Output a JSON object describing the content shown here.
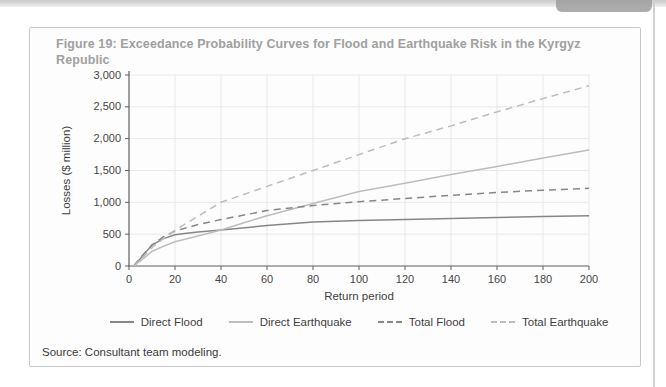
{
  "figure": {
    "title": "Figure 19: Exceedance Probability Curves for Flood and Earthquake Risk in the Kyrgyz Republic",
    "source": "Source: Consultant team modeling."
  },
  "colors": {
    "title": "#a0a0a0",
    "text": "#3f3f3f",
    "tick_text": "#454545",
    "axis": "#5f5f5f",
    "grid": "#e8e8e8",
    "border": "#c8c8c8",
    "dark_series": "#878787",
    "light_series": "#bdbdbd"
  },
  "chart_data": {
    "type": "line",
    "title": "Exceedance Probability Curves for Flood and Earthquake Risk in the Kyrgyz Republic",
    "xlabel": "Return period",
    "ylabel": "Losses ($ million)",
    "xlim": [
      0,
      200
    ],
    "ylim": [
      0,
      3000
    ],
    "grid": true,
    "legend_position": "bottom",
    "x_ticks": [
      0,
      20,
      40,
      60,
      80,
      100,
      120,
      140,
      160,
      180,
      200
    ],
    "x_tick_labels": [
      "0",
      "20",
      "40",
      "60",
      "80",
      "100",
      "120",
      "140",
      "160",
      "180",
      "200"
    ],
    "y_ticks": [
      0,
      500,
      1000,
      1500,
      2000,
      2500,
      3000
    ],
    "y_tick_labels": [
      "0",
      "500",
      "1,000",
      "1,500",
      "2,000",
      "2,500",
      "3,000"
    ],
    "series": [
      {
        "name": "Direct Flood",
        "style": "solid",
        "color": "dark",
        "points": [
          [
            2,
            0
          ],
          [
            5,
            120
          ],
          [
            10,
            330
          ],
          [
            15,
            430
          ],
          [
            20,
            490
          ],
          [
            25,
            515
          ],
          [
            30,
            535
          ],
          [
            40,
            565
          ],
          [
            60,
            635
          ],
          [
            80,
            690
          ],
          [
            100,
            715
          ],
          [
            120,
            730
          ],
          [
            140,
            748
          ],
          [
            160,
            763
          ],
          [
            180,
            778
          ],
          [
            200,
            790
          ]
        ]
      },
      {
        "name": "Direct Earthquake",
        "style": "solid",
        "color": "light",
        "points": [
          [
            2,
            0
          ],
          [
            5,
            80
          ],
          [
            10,
            230
          ],
          [
            15,
            310
          ],
          [
            20,
            380
          ],
          [
            30,
            470
          ],
          [
            40,
            565
          ],
          [
            50,
            680
          ],
          [
            60,
            790
          ],
          [
            80,
            980
          ],
          [
            100,
            1170
          ],
          [
            120,
            1300
          ],
          [
            140,
            1435
          ],
          [
            160,
            1565
          ],
          [
            180,
            1695
          ],
          [
            200,
            1820
          ]
        ]
      },
      {
        "name": "Total Flood",
        "style": "dashed",
        "color": "dark",
        "points": [
          [
            2,
            0
          ],
          [
            5,
            130
          ],
          [
            10,
            330
          ],
          [
            15,
            460
          ],
          [
            20,
            550
          ],
          [
            25,
            600
          ],
          [
            30,
            650
          ],
          [
            40,
            730
          ],
          [
            60,
            870
          ],
          [
            80,
            950
          ],
          [
            100,
            1010
          ],
          [
            120,
            1060
          ],
          [
            140,
            1110
          ],
          [
            160,
            1155
          ],
          [
            180,
            1190
          ],
          [
            200,
            1220
          ]
        ]
      },
      {
        "name": "Total Earthquake",
        "style": "dashed",
        "color": "light",
        "points": [
          [
            2,
            0
          ],
          [
            5,
            100
          ],
          [
            10,
            290
          ],
          [
            15,
            430
          ],
          [
            20,
            560
          ],
          [
            30,
            780
          ],
          [
            40,
            1000
          ],
          [
            60,
            1250
          ],
          [
            80,
            1500
          ],
          [
            100,
            1750
          ],
          [
            120,
            2000
          ],
          [
            140,
            2200
          ],
          [
            160,
            2420
          ],
          [
            180,
            2630
          ],
          [
            200,
            2830
          ]
        ]
      }
    ]
  }
}
